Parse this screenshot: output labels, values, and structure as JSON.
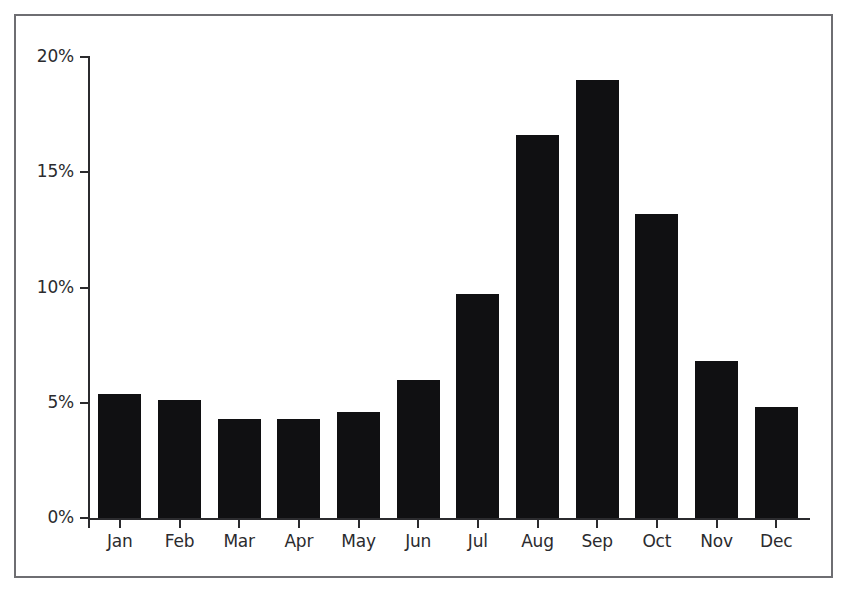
{
  "chart_data": {
    "type": "bar",
    "title": "",
    "subtitle": "",
    "xlabel": "",
    "ylabel": "",
    "categories": [
      "Jan",
      "Feb",
      "Mar",
      "Apr",
      "May",
      "Jun",
      "Jul",
      "Aug",
      "Sep",
      "Oct",
      "Nov",
      "Dec"
    ],
    "values": [
      5.4,
      5.1,
      4.3,
      4.3,
      4.6,
      6.0,
      9.7,
      16.6,
      19.0,
      13.2,
      6.8,
      4.8
    ],
    "value_suffix": "%",
    "ylim": [
      0,
      20
    ],
    "ytick_values": [
      0,
      5,
      10,
      15,
      20
    ],
    "ytick_labels": [
      "0%",
      "5%",
      "10%",
      "15%",
      "20%"
    ],
    "grid": false,
    "legend": null,
    "legend_position": "none",
    "annotations": [],
    "series": [
      {
        "name": "",
        "values": [
          5.4,
          5.1,
          4.3,
          4.3,
          4.6,
          6.0,
          9.7,
          16.6,
          19.0,
          13.2,
          6.8,
          4.8
        ]
      }
    ]
  },
  "style": {
    "bar_color": "#101012",
    "axis_color": "#2b2b2e",
    "frame_color": "#6e6e72",
    "background_color": "#ffffff",
    "text_color": "#2b2b2e"
  }
}
